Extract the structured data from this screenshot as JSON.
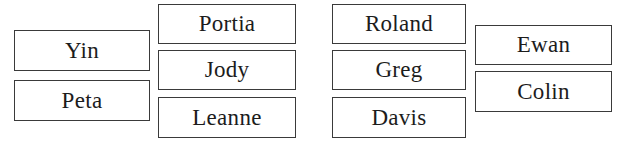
{
  "colors": {
    "border": "#3a3a3a",
    "text": "#1c1c1c",
    "background": "#ffffff"
  },
  "groups": [
    {
      "id": "group-1",
      "boxes": [
        {
          "label": "Yin",
          "x": 14,
          "y": 30,
          "w": 136,
          "h": 41
        },
        {
          "label": "Peta",
          "x": 14,
          "y": 80,
          "w": 136,
          "h": 41
        }
      ]
    },
    {
      "id": "group-2",
      "boxes": [
        {
          "label": "Portia",
          "x": 158,
          "y": 4,
          "w": 138,
          "h": 40
        },
        {
          "label": "Jody",
          "x": 158,
          "y": 50,
          "w": 138,
          "h": 40
        },
        {
          "label": "Leanne",
          "x": 158,
          "y": 97,
          "w": 138,
          "h": 41
        }
      ]
    },
    {
      "id": "group-3",
      "boxes": [
        {
          "label": "Roland",
          "x": 332,
          "y": 4,
          "w": 134,
          "h": 40
        },
        {
          "label": "Greg",
          "x": 332,
          "y": 50,
          "w": 134,
          "h": 40
        },
        {
          "label": "Davis",
          "x": 332,
          "y": 97,
          "w": 134,
          "h": 41
        }
      ]
    },
    {
      "id": "group-4",
      "boxes": [
        {
          "label": "Ewan",
          "x": 475,
          "y": 25,
          "w": 137,
          "h": 40
        },
        {
          "label": "Colin",
          "x": 475,
          "y": 71,
          "w": 137,
          "h": 41
        }
      ]
    }
  ]
}
